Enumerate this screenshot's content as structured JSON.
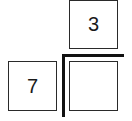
{
  "diagram": {
    "boxes": [
      {
        "id": "top-box",
        "label": "3"
      },
      {
        "id": "left-box",
        "label": "7"
      },
      {
        "id": "target-box",
        "label": ""
      }
    ],
    "colors": {
      "stroke": "#2a2a2a",
      "thick_line": "#111111",
      "background": "#ffffff"
    }
  }
}
